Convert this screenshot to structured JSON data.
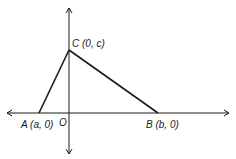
{
  "diagram": {
    "type": "coordinate-triangle",
    "origin_label": "O",
    "points": [
      {
        "id": "A",
        "label": "A (a, 0)",
        "coords": [
          "a",
          "0"
        ]
      },
      {
        "id": "B",
        "label": "B (b, 0)",
        "coords": [
          "b",
          "0"
        ]
      },
      {
        "id": "C",
        "label": "C (0, c)",
        "coords": [
          "0",
          "c"
        ]
      }
    ],
    "segments": [
      [
        "A",
        "C"
      ],
      [
        "C",
        "B"
      ]
    ],
    "colors": {
      "ink": "#1a1a1a",
      "background": "#ffffff"
    }
  }
}
